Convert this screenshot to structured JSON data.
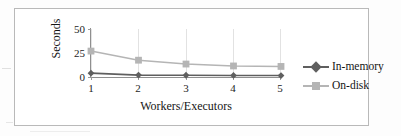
{
  "figure": {
    "frame_border_color": "#b9b9b9",
    "background": "#ffffff"
  },
  "chart_data": {
    "type": "line",
    "title": "",
    "xlabel": "Workers/Executors",
    "ylabel": "Seconds",
    "x": [
      1,
      2,
      3,
      4,
      5
    ],
    "categories": [
      "1",
      "2",
      "3",
      "4",
      "5"
    ],
    "xtick_labels": [
      "1",
      "2",
      "3",
      "4",
      "5"
    ],
    "ytick_labels": [
      "0",
      "25",
      "50"
    ],
    "yticks": [
      0,
      25,
      50
    ],
    "ylim": [
      0,
      50
    ],
    "xlim": [
      1,
      5
    ],
    "grid": "vertical",
    "legend_position": "right",
    "series": [
      {
        "name": "In-memory",
        "values": [
          4,
          2,
          1.8,
          1.6,
          1.5
        ],
        "color": "#5f5f5f",
        "marker": "diamond"
      },
      {
        "name": "On-disk",
        "values": [
          27,
          17.5,
          13.5,
          11.5,
          11
        ],
        "color": "#b5b5b5",
        "marker": "square"
      }
    ]
  },
  "legend": {
    "items": [
      {
        "label": "In-memory",
        "color": "#5f5f5f",
        "marker": "diamond"
      },
      {
        "label": "On-disk",
        "color": "#b5b5b5",
        "marker": "square"
      }
    ]
  }
}
